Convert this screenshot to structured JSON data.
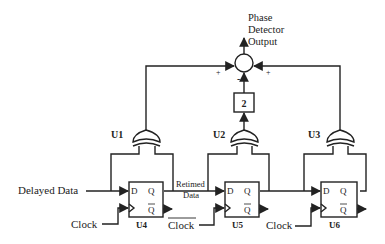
{
  "output": {
    "label_lines": [
      "Phase",
      "Detector",
      "Output"
    ]
  },
  "summer": {
    "signs": {
      "left": "+",
      "right": "+",
      "bottom": "-"
    }
  },
  "gain_block": {
    "label": "2"
  },
  "xor_gates": [
    {
      "id": "U1",
      "label": "U1"
    },
    {
      "id": "U2",
      "label": "U2"
    },
    {
      "id": "U3",
      "label": "U3"
    }
  ],
  "flip_flops": [
    {
      "id": "U4",
      "label": "U4",
      "pin_d": "D",
      "pin_q": "Q",
      "pin_qbar": "Q",
      "clock": "Clock",
      "clock_inverted": false
    },
    {
      "id": "U5",
      "label": "U5",
      "pin_d": "D",
      "pin_q": "Q",
      "pin_qbar": "Q",
      "clock": "Clock",
      "clock_inverted": true
    },
    {
      "id": "U6",
      "label": "U6",
      "pin_d": "D",
      "pin_q": "Q",
      "pin_qbar": "Q",
      "clock": "Clock",
      "clock_inverted": false
    }
  ],
  "signals": {
    "input": "Delayed Data",
    "retimed_lines": [
      "Retimed",
      "Data"
    ]
  }
}
